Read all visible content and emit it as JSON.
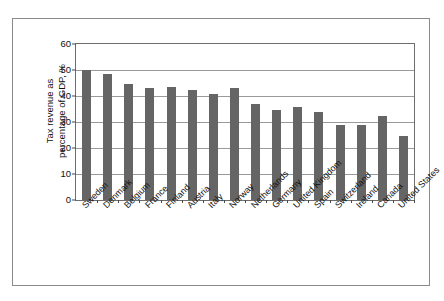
{
  "chart_data": {
    "type": "bar",
    "title": "",
    "subtitle": "",
    "xlabel": "",
    "ylabel": "Tax revenue as percentage of GDP, %",
    "ylabel_lines": [
      "Tax revenue as",
      "percentage of GDP, %"
    ],
    "ylim": [
      0,
      60
    ],
    "yticks": [
      0,
      10,
      20,
      30,
      40,
      50,
      60
    ],
    "ytick_labels": [
      "0",
      "10",
      "20",
      "30",
      "40",
      "50",
      "60"
    ],
    "grid": "horizontal",
    "legend": "none",
    "bar_color": "#656565",
    "categories": [
      "Sweden",
      "Denmark",
      "Belgium",
      "France",
      "Finland",
      "Austria",
      "Italy",
      "Norway",
      "Netherlands",
      "Germany",
      "United Kingdom",
      "Spain",
      "Switzerland",
      "Ireland",
      "Canada",
      "United States"
    ],
    "values": [
      50.0,
      48.5,
      44.5,
      43.0,
      43.5,
      42.2,
      40.6,
      43.0,
      37.0,
      34.5,
      35.6,
      34.0,
      29.0,
      29.0,
      32.5,
      24.8
    ]
  }
}
